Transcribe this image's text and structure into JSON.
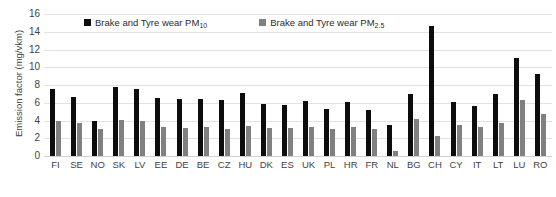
{
  "chart_data": {
    "type": "bar",
    "title": "",
    "xlabel": "",
    "ylabel": "Emission factor (mg/vkm)",
    "ylim": [
      0,
      16
    ],
    "ytick_step": 2,
    "yticks": [
      16,
      14,
      12,
      10,
      8,
      6,
      4,
      2,
      0
    ],
    "grid": true,
    "legend_position": "top",
    "categories": [
      "FI",
      "SE",
      "NO",
      "SK",
      "LV",
      "EE",
      "DE",
      "BE",
      "CZ",
      "HU",
      "DK",
      "ES",
      "UK",
      "PL",
      "HR",
      "FR",
      "NL",
      "BG",
      "CH",
      "CY",
      "IT",
      "LT",
      "LU",
      "RO"
    ],
    "series": [
      {
        "name": "Brake and Tyre wear PM10",
        "name_base": "Brake and Tyre wear PM",
        "name_sub": "10",
        "color": "#0d0d0d",
        "values": [
          7.6,
          6.6,
          4.0,
          7.8,
          7.5,
          6.5,
          6.4,
          6.4,
          6.3,
          7.1,
          5.9,
          5.8,
          6.2,
          5.3,
          6.1,
          5.2,
          3.5,
          7.0,
          14.6,
          6.1,
          5.6,
          7.0,
          11.0,
          9.2
        ]
      },
      {
        "name": "Brake and Tyre wear PM2.5",
        "name_base": "Brake and Tyre wear PM",
        "name_sub": "2.5",
        "color": "#808080",
        "values": [
          4.0,
          3.7,
          3.0,
          4.1,
          4.0,
          3.3,
          3.2,
          3.3,
          3.0,
          3.4,
          3.2,
          3.2,
          3.3,
          3.0,
          3.3,
          3.0,
          0.6,
          4.2,
          2.2,
          3.5,
          3.3,
          3.7,
          6.3,
          4.7
        ]
      }
    ]
  }
}
